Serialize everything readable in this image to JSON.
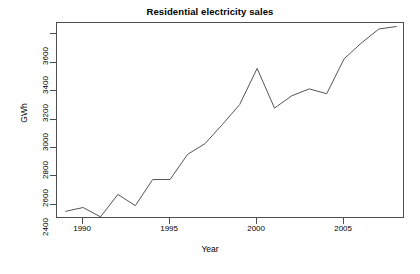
{
  "chart_data": {
    "type": "line",
    "title": "Residential electricity sales",
    "xlabel": "Year",
    "ylabel": "GWh",
    "x": [
      1989,
      1990,
      1991,
      1992,
      1993,
      1994,
      1995,
      1996,
      1997,
      1998,
      1999,
      2000,
      2001,
      2002,
      2003,
      2004,
      2005,
      2006,
      2007,
      2008
    ],
    "values": [
      2354,
      2381,
      2315,
      2473,
      2394,
      2578,
      2578,
      2755,
      2830,
      2965,
      3106,
      3360,
      3081,
      3168,
      3216,
      3182,
      3428,
      3540,
      3638,
      3655
    ],
    "series": [
      {
        "name": "Residential electricity sales",
        "values": [
          2354,
          2381,
          2315,
          2473,
          2394,
          2578,
          2578,
          2755,
          2830,
          2965,
          3106,
          3360,
          3081,
          3168,
          3216,
          3182,
          3428,
          3540,
          3638,
          3655
        ]
      }
    ],
    "xlim": [
      1988.5,
      2008.5
    ],
    "ylim": [
      2300,
      3680
    ],
    "xticks": [
      1990,
      1995,
      2000,
      2005
    ],
    "yticks": [
      2400,
      2600,
      2800,
      3000,
      3200,
      3400,
      3600
    ],
    "grid": false,
    "legend": false,
    "line_color": "#555555",
    "background_color": "#ffffff",
    "axis_color": "#4d4d4d"
  }
}
